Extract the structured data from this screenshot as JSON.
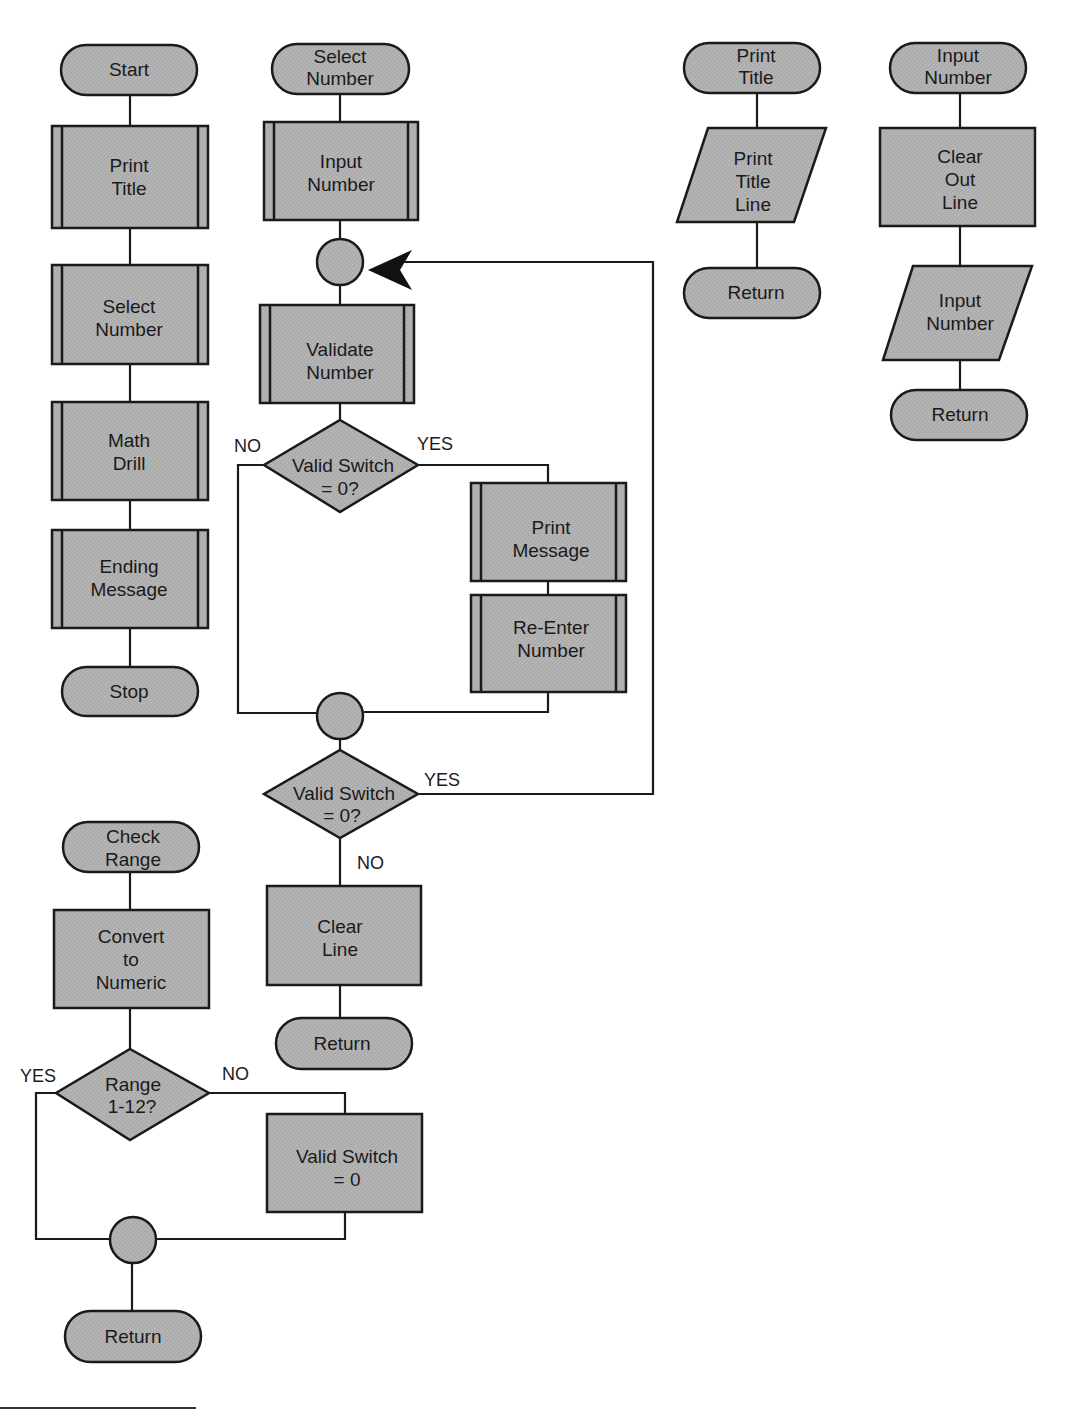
{
  "colors": {
    "fill": "#b3b3b3",
    "stroke": "#1a1a1a",
    "background": "#ffffff"
  },
  "main_module": {
    "terminal_start": "Start",
    "print_title": [
      "Print",
      "Title"
    ],
    "select_number": [
      "Select",
      "Number"
    ],
    "math_drill": [
      "Math",
      "Drill"
    ],
    "ending_message": [
      "Ending",
      "Message"
    ],
    "terminal_stop": "Stop"
  },
  "select_number_module": {
    "terminal_start": [
      "Select",
      "Number"
    ],
    "input_number": [
      "Input",
      "Number"
    ],
    "validate_number": [
      "Validate",
      "Number"
    ],
    "decision1": [
      "Valid Switch",
      "= 0?"
    ],
    "decision1_no": "NO",
    "decision1_yes": "YES",
    "print_message": [
      "Print",
      "Message"
    ],
    "reenter_number": [
      "Re-Enter",
      "Number"
    ],
    "decision2": [
      "Valid Switch",
      "= 0?"
    ],
    "decision2_yes": "YES",
    "decision2_no": "NO",
    "clear_line": [
      "Clear",
      "Line"
    ],
    "terminal_return": "Return"
  },
  "print_title_module": {
    "terminal_start": [
      "Print",
      "Title"
    ],
    "print_title_line": [
      "Print",
      "Title",
      "Line"
    ],
    "terminal_return": "Return"
  },
  "input_number_module": {
    "terminal_start": [
      "Input",
      "Number"
    ],
    "clear_out_line": [
      "Clear",
      "Out",
      "Line"
    ],
    "input_number_io": [
      "Input",
      "Number"
    ],
    "terminal_return": "Return"
  },
  "check_range_module": {
    "terminal_start": [
      "Check",
      "Range"
    ],
    "convert_numeric": [
      "Convert",
      "to",
      "Numeric"
    ],
    "decision": [
      "Range",
      "1-12?"
    ],
    "decision_yes": "YES",
    "decision_no": "NO",
    "set_valid_switch": [
      "Valid Switch",
      "= 0"
    ],
    "terminal_return": "Return"
  }
}
